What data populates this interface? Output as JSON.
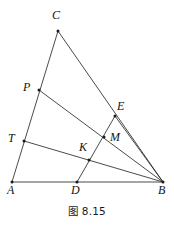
{
  "figure": {
    "caption": "图 8.15",
    "width": 174,
    "height": 227,
    "background_color": "#ffffff",
    "line_color": "#2b2b2b",
    "label_color": "#141414",
    "points": [
      {
        "id": "C",
        "label": "C",
        "x": 58,
        "y": 31,
        "label_x": 52,
        "label_y": 9
      },
      {
        "id": "P",
        "label": "P",
        "x": 39,
        "y": 90,
        "label_x": 23,
        "label_y": 81
      },
      {
        "id": "E",
        "label": "E",
        "x": 115,
        "y": 116,
        "label_x": 117,
        "label_y": 100
      },
      {
        "id": "T",
        "label": "T",
        "x": 24,
        "y": 141,
        "label_x": 8,
        "label_y": 132
      },
      {
        "id": "M",
        "label": "M",
        "x": 104,
        "y": 137,
        "label_x": 110,
        "label_y": 131
      },
      {
        "id": "K",
        "label": "K",
        "x": 89,
        "y": 160,
        "label_x": 79,
        "label_y": 141
      },
      {
        "id": "A",
        "label": "A",
        "x": 12,
        "y": 182,
        "label_x": 7,
        "label_y": 184
      },
      {
        "id": "D",
        "label": "D",
        "x": 77,
        "y": 182,
        "label_x": 71,
        "label_y": 184
      },
      {
        "id": "B",
        "label": "B",
        "x": 163,
        "y": 182,
        "label_x": 158,
        "label_y": 184
      }
    ],
    "segments": [
      {
        "id": "AC",
        "from": "A",
        "to": "C",
        "name": "segment-a-c"
      },
      {
        "id": "CB",
        "from": "C",
        "to": "B",
        "name": "segment-c-b"
      },
      {
        "id": "AB",
        "from": "A",
        "to": "B",
        "name": "segment-a-b"
      },
      {
        "id": "PB",
        "from": "P",
        "to": "B",
        "name": "segment-p-b"
      },
      {
        "id": "TB",
        "from": "T",
        "to": "B",
        "name": "segment-t-b"
      },
      {
        "id": "DE",
        "from": "D",
        "to": "E",
        "name": "segment-d-e"
      },
      {
        "id": "EB",
        "from": "E",
        "to": "B",
        "name": "segment-e-b"
      }
    ]
  }
}
